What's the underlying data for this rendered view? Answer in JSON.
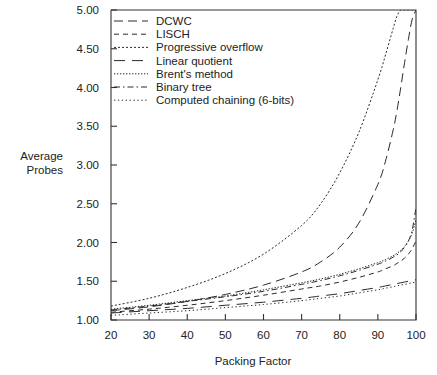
{
  "chart_data": {
    "type": "line",
    "title": "",
    "xlabel": "Packing Factor",
    "ylabel": "Average Probes",
    "ylabel_line1": "Average",
    "ylabel_line2": "Probes",
    "xlim": [
      20,
      100
    ],
    "ylim": [
      1.0,
      5.0
    ],
    "xticks": [
      20,
      30,
      40,
      50,
      60,
      70,
      80,
      90,
      100
    ],
    "yticks": [
      1.0,
      1.5,
      2.0,
      2.5,
      3.0,
      3.5,
      4.0,
      4.5,
      5.0
    ],
    "xtick_labels": [
      "20",
      "30",
      "40",
      "50",
      "60",
      "70",
      "80",
      "90",
      "100"
    ],
    "ytick_labels": [
      "1.00",
      "1.50",
      "2.00",
      "2.50",
      "3.00",
      "3.50",
      "4.00",
      "4.50",
      "5.00"
    ],
    "grid": false,
    "legend_position": "top-left-inside",
    "x": [
      20,
      30,
      40,
      50,
      60,
      70,
      75,
      80,
      85,
      90,
      92,
      94,
      95,
      96,
      97,
      98,
      99,
      100
    ],
    "series": [
      {
        "name": "DCWC",
        "dash": "9,5",
        "values": [
          1.12,
          1.17,
          1.24,
          1.33,
          1.45,
          1.62,
          1.75,
          1.94,
          2.25,
          2.75,
          3.05,
          3.45,
          3.7,
          4.0,
          4.32,
          4.62,
          4.88,
          5.0
        ]
      },
      {
        "name": "LISCH",
        "dash": "5,4",
        "values": [
          1.1,
          1.14,
          1.19,
          1.25,
          1.32,
          1.4,
          1.44,
          1.49,
          1.55,
          1.62,
          1.66,
          1.7,
          1.73,
          1.76,
          1.8,
          1.85,
          1.92,
          2.02
        ]
      },
      {
        "name": "Progressive overflow",
        "dash": "2,2",
        "values": [
          1.18,
          1.28,
          1.42,
          1.6,
          1.85,
          2.22,
          2.5,
          2.9,
          3.42,
          4.1,
          4.42,
          4.76,
          4.92,
          5.0,
          5.0,
          5.0,
          5.0,
          5.0
        ]
      },
      {
        "name": "Linear quotient",
        "dash": "11,7",
        "values": [
          1.09,
          1.12,
          1.15,
          1.19,
          1.23,
          1.28,
          1.31,
          1.34,
          1.38,
          1.42,
          1.44,
          1.46,
          1.47,
          1.48,
          1.49,
          1.5,
          1.51,
          1.52
        ]
      },
      {
        "name": "Brent's method",
        "dash": "1.4,1.6",
        "values": [
          1.14,
          1.19,
          1.25,
          1.31,
          1.39,
          1.48,
          1.53,
          1.59,
          1.66,
          1.74,
          1.78,
          1.83,
          1.86,
          1.9,
          1.95,
          2.02,
          2.12,
          2.3
        ]
      },
      {
        "name": "Binary tree",
        "dash": "6,3,1.5,3",
        "values": [
          1.13,
          1.18,
          1.24,
          1.3,
          1.37,
          1.46,
          1.51,
          1.57,
          1.64,
          1.72,
          1.76,
          1.81,
          1.84,
          1.88,
          1.94,
          2.02,
          2.16,
          2.45
        ]
      },
      {
        "name": "Computed chaining (6-bits)",
        "dash": "1.3,2.6",
        "values": [
          1.06,
          1.09,
          1.12,
          1.16,
          1.2,
          1.25,
          1.28,
          1.31,
          1.35,
          1.39,
          1.41,
          1.43,
          1.44,
          1.45,
          1.46,
          1.47,
          1.48,
          1.49
        ]
      }
    ],
    "legend_entries": [
      "DCWC",
      "LISCH",
      "Progressive overflow",
      "Linear quotient",
      "Brent's method",
      "Binary tree",
      "Computed chaining (6-bits)"
    ]
  },
  "colors": {
    "axis": "#333333",
    "curve": "#2a2a2a",
    "background": "#ffffff",
    "text": "#222222"
  }
}
